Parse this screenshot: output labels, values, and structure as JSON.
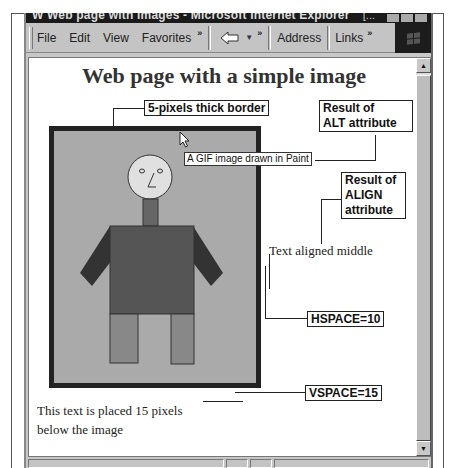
{
  "window": {
    "title": "W Web page with images - Microsoft Internet Explorer",
    "title_ellipsis": "[...",
    "menu": [
      {
        "label": "File",
        "accel": "F"
      },
      {
        "label": "Edit",
        "accel": "E"
      },
      {
        "label": "View",
        "accel": "V"
      },
      {
        "label": "Favorites",
        "accel": "a"
      }
    ],
    "chevron": "»",
    "address_label": "Address",
    "links_label": "Links"
  },
  "page": {
    "title": "Web page with a simple image",
    "image_alt_tooltip": "A GIF image drawn in Paint",
    "text_aligned": "Text aligned middle",
    "below_text_line1": "This text is placed 15 pixels",
    "below_text_line2": "below the image"
  },
  "callouts": {
    "border": "5-pixels thick border",
    "alt_line1": "Result of",
    "alt_line2": "ALT attribute",
    "align_line1": "Result of",
    "align_line2": "ALIGN",
    "align_line3": "attribute",
    "hspace": "HSPACE=10",
    "vspace": "VSPACE=15"
  },
  "colors": {
    "image_background": "#aaaaaa",
    "image_border": "#222222",
    "shirt": "#555555",
    "arms": "#333333",
    "legs": "#888888",
    "neck": "#666666",
    "head": "#e0e0e0"
  }
}
